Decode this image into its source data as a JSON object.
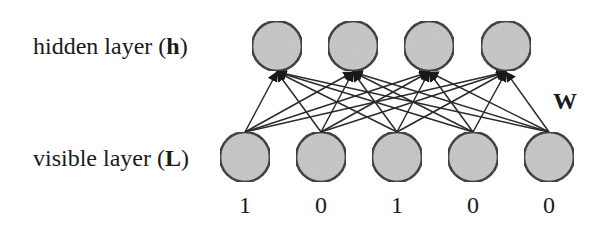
{
  "labels": {
    "hidden_prefix": "hidden layer (",
    "hidden_symbol": "h",
    "hidden_suffix": ")",
    "visible_prefix": "visible layer (",
    "visible_symbol": "L",
    "visible_suffix": ")",
    "weights": "W"
  },
  "colors": {
    "node_fill": "#c6c6c6",
    "node_stroke": "#222222",
    "edge": "#2a2a2a",
    "text": "#1a1a1a"
  },
  "hidden_layer": {
    "nodes": [
      {
        "id": "h1",
        "cx": 277,
        "cy": 46
      },
      {
        "id": "h2",
        "cx": 353,
        "cy": 46
      },
      {
        "id": "h3",
        "cx": 429,
        "cy": 46
      },
      {
        "id": "h4",
        "cx": 506,
        "cy": 46
      }
    ]
  },
  "visible_layer": {
    "nodes": [
      {
        "id": "v1",
        "cx": 245,
        "cy": 157,
        "value": "1"
      },
      {
        "id": "v2",
        "cx": 321,
        "cy": 157,
        "value": "0"
      },
      {
        "id": "v3",
        "cx": 397,
        "cy": 157,
        "value": "1"
      },
      {
        "id": "v4",
        "cx": 473,
        "cy": 157,
        "value": "0"
      },
      {
        "id": "v5",
        "cx": 549,
        "cy": 157,
        "value": "0"
      }
    ]
  },
  "node_radius": 25,
  "connectivity": "fully-connected visible-to-hidden, arrows pointing to hidden nodes"
}
